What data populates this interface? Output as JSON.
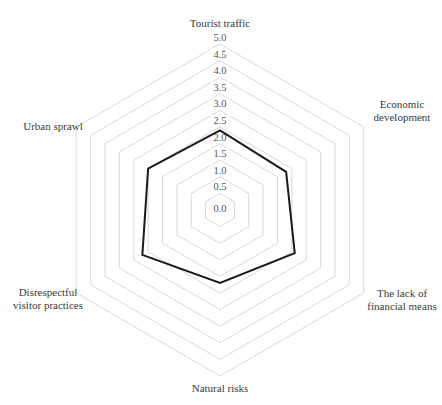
{
  "chart_data": {
    "type": "radar",
    "title": "",
    "categories": [
      "Tourist traffic",
      "Economic development",
      "The lack of financial means",
      "Natural risks",
      "Disrespectful visitor practices",
      "Urban sprawl"
    ],
    "category_label_lines": [
      [
        "Tourist traffic"
      ],
      [
        "Economic",
        "development"
      ],
      [
        "The lack of",
        "financial means"
      ],
      [
        "Natural risks"
      ],
      [
        "Disrespectful",
        "visitor practices"
      ],
      [
        "Urban sprawl"
      ]
    ],
    "series": [
      {
        "name": "Score",
        "values": [
          2.4,
          2.3,
          2.6,
          2.2,
          2.7,
          2.5
        ]
      }
    ],
    "rlim": [
      0,
      5
    ],
    "ticks": [
      "0.0",
      "0.5",
      "1.0",
      "1.5",
      "2.0",
      "2.5",
      "3.0",
      "3.5",
      "4.0",
      "4.5",
      "5.0"
    ],
    "grid": true,
    "legend": "none",
    "colors": {
      "series": "#1a1a1a",
      "grid": "#d9d9d9"
    }
  }
}
